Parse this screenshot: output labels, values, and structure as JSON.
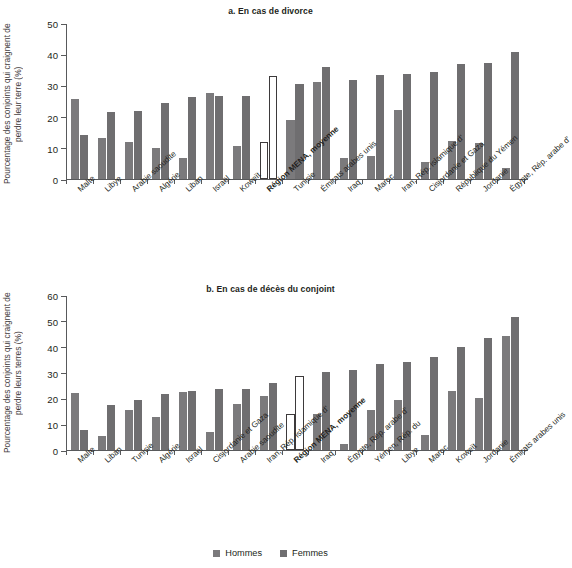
{
  "figure": {
    "top_clipped_title": "",
    "legend": [
      {
        "key": "hommes",
        "label": "Hommes",
        "color": "#7b7a7c"
      },
      {
        "key": "femmes",
        "label": "Femmes",
        "color": "#6f6e70"
      }
    ]
  },
  "panel_a": {
    "title": "a. En cas de divorce",
    "ylabel": "Pourcentage des conjoints qui craignent de perdre leur terre (%)"
  },
  "panel_b": {
    "title": "b. En cas de décès du conjoint",
    "ylabel": "Pourcentage des conjoints qui craignent de perdre leurs terres (%)"
  },
  "chart_data": [
    {
      "type": "bar",
      "id": "panel-a",
      "title": "a. En cas de divorce",
      "xlabel": "",
      "ylabel": "Pourcentage des conjoints qui craignent de perdre leur terre (%)",
      "ylim": [
        0,
        50
      ],
      "yticks": [
        0,
        10,
        20,
        30,
        40,
        50
      ],
      "grid": false,
      "legend_position": "bottom-center",
      "highlight_category": "Région MENA, moyenne",
      "highlight_style": "hollow-white-outline",
      "categories": [
        "Malte",
        "Libye",
        "Arabie saoudite",
        "Algérie",
        "Liban",
        "Israël",
        "Koweït",
        "Région MENA, moyenne",
        "Tunisie",
        "Émirats arabes unis",
        "Iraq",
        "Maroc",
        "Iran, Rép. islamique d'",
        "Cisjordanie et Gaza",
        "République du Yémen",
        "Jordanie",
        "Égypte, Rép. arabe d'"
      ],
      "series": [
        {
          "name": "Hommes",
          "color": "#7b7a7c",
          "values": [
            25.8,
            13.1,
            11.9,
            9.9,
            6.6,
            27.7,
            10.7,
            12.0,
            18.9,
            31.0,
            6.7,
            7.3,
            22.0,
            5.6,
            12.3,
            11.5,
            3.6
          ]
        },
        {
          "name": "Femmes",
          "color": "#6f6e70",
          "values": [
            14.0,
            21.4,
            21.8,
            24.5,
            26.3,
            26.6,
            26.7,
            33.1,
            30.3,
            36.0,
            31.7,
            33.2,
            33.7,
            34.3,
            36.8,
            37.1,
            40.7
          ]
        }
      ]
    },
    {
      "type": "bar",
      "id": "panel-b",
      "title": "b. En cas de décès du conjoint",
      "xlabel": "",
      "ylabel": "Pourcentage des conjoints qui craignent de perdre leurs terres (%)",
      "ylim": [
        0,
        60
      ],
      "yticks": [
        0,
        10,
        20,
        30,
        40,
        50,
        60
      ],
      "grid": false,
      "legend_position": "bottom-center",
      "highlight_category": "Région MENA, moyenne",
      "highlight_style": "hollow-white-outline",
      "categories": [
        "Malte",
        "Liban",
        "Tunisie",
        "Algérie",
        "Israël",
        "Cisjordanie et Gaza",
        "Arabie saoudite",
        "Iran, Rép. islamique d'",
        "Région MENA, moyenne",
        "Iraq",
        "Égypte, Rép. arabe d'",
        "Yémen, Rép. du",
        "Libye",
        "Maroc",
        "Koweït",
        "Jordanie",
        "Émirats arabes unis"
      ],
      "series": [
        {
          "name": "Hommes",
          "color": "#7b7a7c",
          "values": [
            22.2,
            5.6,
            15.3,
            12.9,
            22.6,
            6.9,
            17.9,
            21.0,
            14.1,
            13.8,
            2.5,
            15.6,
            19.5,
            5.9,
            22.8,
            20.0,
            44.3
          ]
        },
        {
          "name": "Femmes",
          "color": "#6f6e70",
          "values": [
            7.7,
            17.3,
            19.3,
            21.5,
            22.8,
            23.6,
            23.8,
            26.0,
            28.6,
            30.1,
            31.1,
            33.2,
            34.0,
            36.0,
            40.0,
            43.5,
            51.3
          ]
        }
      ]
    }
  ]
}
